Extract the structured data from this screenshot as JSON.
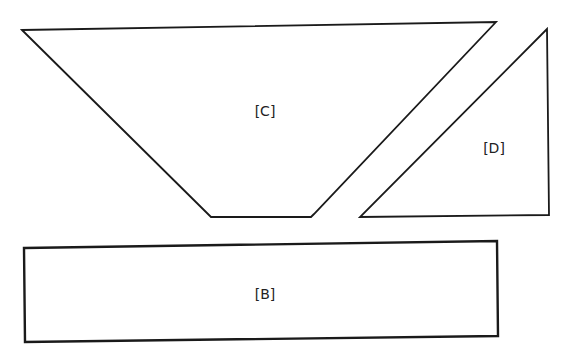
{
  "diagram": {
    "shapes": [
      {
        "id": "C",
        "label": "[C]",
        "type": "trapezoid",
        "points": [
          [
            22,
            30
          ],
          [
            496,
            22
          ],
          [
            314,
            214
          ],
          [
            311,
            217
          ],
          [
            211,
            217
          ]
        ],
        "label_pos": [
          265,
          116
        ]
      },
      {
        "id": "D",
        "label": "[D]",
        "type": "triangle",
        "points": [
          [
            547,
            29
          ],
          [
            549,
            215
          ],
          [
            360,
            217
          ]
        ],
        "label_pos": [
          494,
          153
        ]
      },
      {
        "id": "B",
        "label": "[B]",
        "type": "rectangle",
        "points": [
          [
            24,
            248
          ],
          [
            497,
            241
          ],
          [
            498,
            336
          ],
          [
            25,
            342
          ]
        ],
        "label_pos": [
          265,
          299
        ]
      }
    ],
    "stroke_color": "#1a1a1a",
    "background": "#ffffff"
  }
}
